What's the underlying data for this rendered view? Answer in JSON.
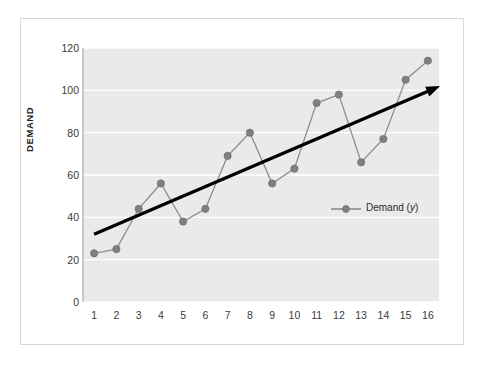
{
  "chart_data": {
    "type": "line",
    "title": "",
    "xlabel": "",
    "ylabel": "DEMAND",
    "xlim": [
      0.5,
      16.5
    ],
    "ylim": [
      0,
      120
    ],
    "grid": true,
    "legend_position": "inside-right",
    "x": [
      1,
      2,
      3,
      4,
      5,
      6,
      7,
      8,
      9,
      10,
      11,
      12,
      13,
      14,
      15,
      16
    ],
    "xtick_labels": [
      "1",
      "2",
      "3",
      "4",
      "5",
      "6",
      "7",
      "8",
      "9",
      "10",
      "11",
      "12",
      "13",
      "14",
      "15",
      "16"
    ],
    "ytick_labels": [
      "0",
      "20",
      "40",
      "60",
      "80",
      "100",
      "120"
    ],
    "ytick_values": [
      0,
      20,
      40,
      60,
      80,
      100,
      120
    ],
    "series": [
      {
        "name": "Demand (y)",
        "legend_label_plain": "Demand (",
        "legend_label_italic": "y",
        "legend_label_tail": ")",
        "color": "#808080",
        "marker": "circle",
        "values": [
          23,
          25,
          44,
          56,
          38,
          44,
          69,
          80,
          56,
          63,
          94,
          98,
          66,
          77,
          105,
          114
        ]
      }
    ],
    "annotations": [
      {
        "type": "trendline-arrow",
        "color": "#000000",
        "x_start": 1,
        "y_start": 32,
        "x_end": 16.55,
        "y_end": 102
      }
    ],
    "colors": {
      "plot_background": "#eaeaea",
      "figure_background": "#ffffff",
      "gridline": "#ffffff",
      "series": "#808080",
      "trendline": "#000000",
      "tick_text": "#3a3a3a",
      "axis_title_text": "#1d1d1d",
      "frame_border": "#d8d8d8"
    }
  }
}
